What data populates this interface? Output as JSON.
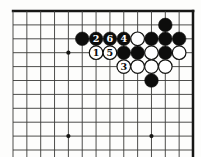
{
  "diagram": {
    "kind": "go-board-diagram",
    "board_region": "top-right-corner",
    "grid": {
      "cols": 14,
      "rows": 11,
      "col_start_x": 13,
      "row_start_y": 11,
      "col_spacing": 13.846,
      "row_spacing": 13.9,
      "thick_top_row": 1,
      "thick_right_col": 14,
      "line_width": 0.9,
      "border_width": 2.5,
      "bottom_cut_y": 157
    },
    "colors": {
      "background": "#fdfdfc",
      "line": "#3a3a38",
      "border": "#161614",
      "black_stone": "#0d0d0c",
      "white_stone": "#ffffff",
      "stone_outline": "#141412",
      "black_label_text": "#ffffff",
      "white_label_text": "#0d0d0c"
    },
    "stone_radius": 6.8,
    "star_point_radius": 2.1,
    "star_points": [
      {
        "col": 5,
        "row": 4
      },
      {
        "col": 5,
        "row": 10
      },
      {
        "col": 11,
        "row": 10
      }
    ],
    "stones": [
      {
        "col": 12,
        "row": 2,
        "color": "black"
      },
      {
        "col": 6,
        "row": 3,
        "color": "black"
      },
      {
        "col": 7,
        "row": 3,
        "color": "black",
        "label": "2"
      },
      {
        "col": 8,
        "row": 3,
        "color": "black",
        "label": "6"
      },
      {
        "col": 9,
        "row": 3,
        "color": "black",
        "label": "4"
      },
      {
        "col": 10,
        "row": 3,
        "color": "white"
      },
      {
        "col": 11,
        "row": 3,
        "color": "black"
      },
      {
        "col": 12,
        "row": 3,
        "color": "black"
      },
      {
        "col": 13,
        "row": 3,
        "color": "black"
      },
      {
        "col": 7,
        "row": 4,
        "color": "white",
        "label": "1"
      },
      {
        "col": 8,
        "row": 4,
        "color": "white",
        "label": "5"
      },
      {
        "col": 9,
        "row": 4,
        "color": "black"
      },
      {
        "col": 10,
        "row": 4,
        "color": "black"
      },
      {
        "col": 11,
        "row": 4,
        "color": "white"
      },
      {
        "col": 12,
        "row": 4,
        "color": "black"
      },
      {
        "col": 13,
        "row": 4,
        "color": "white"
      },
      {
        "col": 9,
        "row": 5,
        "color": "white",
        "label": "3"
      },
      {
        "col": 10,
        "row": 5,
        "color": "white"
      },
      {
        "col": 11,
        "row": 5,
        "color": "white"
      },
      {
        "col": 12,
        "row": 5,
        "color": "white"
      },
      {
        "col": 11,
        "row": 6,
        "color": "black"
      }
    ],
    "move_labels": [
      "1",
      "2",
      "3",
      "4",
      "5",
      "6"
    ]
  }
}
